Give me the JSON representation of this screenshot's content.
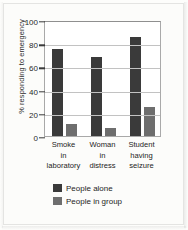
{
  "figure": {
    "caption": ""
  },
  "chart_data": {
    "type": "bar",
    "title": "",
    "xlabel": "",
    "ylabel": "% responding to emergency",
    "ylim": [
      0,
      100
    ],
    "yticks": [
      0,
      20,
      40,
      60,
      80,
      100
    ],
    "grid": true,
    "legend_position": "bottom-left",
    "categories": [
      "Smoke\nin\nlaboratory",
      "Woman\nin\ndistress",
      "Student\nhaving\nseizure"
    ],
    "category_lines": [
      [
        "Smoke",
        "in",
        "laboratory"
      ],
      [
        "Woman",
        "in",
        "distress"
      ],
      [
        "Student",
        "having",
        "seizure"
      ]
    ],
    "series": [
      {
        "name": "People alone",
        "color": "#3a3a3a",
        "values": [
          75,
          68,
          85
        ]
      },
      {
        "name": "People in group",
        "color": "#6e6e6e",
        "values": [
          10,
          7,
          25
        ]
      }
    ]
  }
}
